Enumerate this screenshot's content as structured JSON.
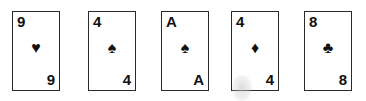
{
  "cards": [
    {
      "rank": "9",
      "suit": "♥",
      "suit_name": "hearts",
      "left": 12
    },
    {
      "rank": "4",
      "suit": "♠",
      "suit_name": "spades",
      "left": 88
    },
    {
      "rank": "A",
      "suit": "♠",
      "suit_name": "spades",
      "left": 161
    },
    {
      "rank": "4",
      "suit": "♦",
      "suit_name": "diamonds",
      "left": 231
    },
    {
      "rank": "8",
      "suit": "♣",
      "suit_name": "clubs",
      "left": 304
    }
  ]
}
